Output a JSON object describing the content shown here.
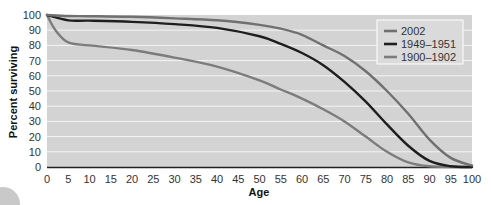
{
  "chart_data": {
    "type": "line",
    "title": "",
    "xlabel": "Age",
    "ylabel": "Percent surviving",
    "xlim": [
      0,
      100
    ],
    "ylim": [
      0,
      100
    ],
    "x_ticks": [
      0,
      5,
      10,
      15,
      20,
      25,
      30,
      35,
      40,
      45,
      50,
      55,
      60,
      65,
      70,
      75,
      80,
      85,
      90,
      95,
      100
    ],
    "y_ticks": [
      0,
      10,
      20,
      30,
      40,
      50,
      60,
      70,
      80,
      90,
      100
    ],
    "grid": "horizontal",
    "legend_position": "top-right",
    "series": [
      {
        "name": "2002",
        "color": "#707070",
        "x": [
          0,
          5,
          10,
          20,
          30,
          40,
          50,
          55,
          60,
          65,
          70,
          75,
          80,
          85,
          90,
          95,
          100
        ],
        "values": [
          100,
          99.3,
          99.2,
          98.8,
          97.8,
          96.5,
          93.5,
          91,
          87,
          80,
          73,
          63,
          50,
          35,
          18,
          6,
          1
        ]
      },
      {
        "name": "1949–1951",
        "color": "#1e1e1e",
        "x": [
          0,
          5,
          10,
          20,
          30,
          40,
          50,
          55,
          60,
          65,
          70,
          75,
          80,
          85,
          90,
          95,
          100
        ],
        "values": [
          100,
          96.5,
          96.3,
          95.5,
          94,
          91.5,
          86,
          81,
          75,
          67,
          56,
          43,
          28,
          14,
          4,
          0.5,
          0
        ]
      },
      {
        "name": "1900–1902",
        "color": "#7c7c7c",
        "x": [
          0,
          2,
          5,
          10,
          20,
          30,
          40,
          50,
          55,
          60,
          65,
          70,
          75,
          80,
          85,
          90,
          100
        ],
        "values": [
          100,
          90,
          82,
          80,
          77,
          72,
          66,
          57,
          51,
          45,
          38,
          30,
          20,
          10,
          3,
          0.5,
          0
        ]
      }
    ]
  },
  "colors": {
    "plot_background": "#d3d3d3",
    "gridline": "#f4f4f4",
    "legend_background": "#dadada",
    "legend_border": "#ffffff"
  }
}
